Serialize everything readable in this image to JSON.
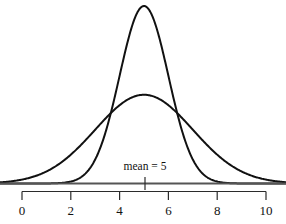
{
  "figure": {
    "title": "",
    "background_color": "#ffffff",
    "curve_color": "#111111",
    "baseline_color": "#555555",
    "axis_color": "#2b2b2b"
  },
  "annotations": {
    "mean_label": "mean = 5"
  },
  "axis": {
    "tick_labels": [
      "0",
      "2",
      "4",
      "6",
      "8",
      "10"
    ],
    "tick_values": [
      0,
      2,
      4,
      6,
      8,
      10
    ],
    "min": 0,
    "max": 10
  },
  "chart_data": {
    "type": "line",
    "title": "",
    "xlabel": "",
    "ylabel": "",
    "xlim": [
      0,
      10
    ],
    "ylim": [
      0,
      0.42
    ],
    "grid": false,
    "legend_position": "none",
    "annotations": [
      {
        "text": "mean = 5",
        "x": 5,
        "y": 0.04
      }
    ],
    "xticks": [
      0,
      2,
      4,
      6,
      8,
      10
    ],
    "xticklabels": [
      "0",
      "2",
      "4",
      "6",
      "8",
      "10"
    ],
    "series": [
      {
        "name": "narrow normal (mean = 5, sd = 1)",
        "distribution": "normal",
        "mean": 5,
        "sd": 1,
        "peak_height": 0.399,
        "x": [
          0,
          0.5,
          1,
          1.5,
          2,
          2.5,
          3,
          3.5,
          4,
          4.5,
          5,
          5.5,
          6,
          6.5,
          7,
          7.5,
          8,
          8.5,
          9,
          9.5,
          10
        ],
        "values": [
          0.0,
          0.0,
          0.0001,
          0.0009,
          0.0044,
          0.0175,
          0.054,
          0.1295,
          0.242,
          0.3521,
          0.3989,
          0.3521,
          0.242,
          0.1295,
          0.054,
          0.0175,
          0.0044,
          0.0009,
          0.0001,
          0.0,
          0.0
        ]
      },
      {
        "name": "wide normal (mean = 5, sd = 2)",
        "distribution": "normal",
        "mean": 5,
        "sd": 2,
        "peak_height": 0.199,
        "x": [
          0,
          0.5,
          1,
          1.5,
          2,
          2.5,
          3,
          3.5,
          4,
          4.5,
          5,
          5.5,
          6,
          6.5,
          7,
          7.5,
          8,
          8.5,
          9,
          9.5,
          10
        ],
        "values": [
          0.0088,
          0.0158,
          0.027,
          0.0431,
          0.0648,
          0.0913,
          0.121,
          0.1506,
          0.176,
          0.1933,
          0.1995,
          0.1933,
          0.176,
          0.1506,
          0.121,
          0.0913,
          0.0648,
          0.0431,
          0.027,
          0.0158,
          0.0088
        ]
      }
    ]
  }
}
